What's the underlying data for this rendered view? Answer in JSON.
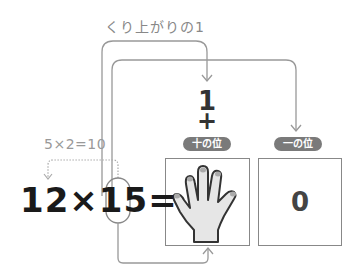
{
  "diagram": {
    "title": "くり上がりの1",
    "carry_digit": "1",
    "plus_sign": "+",
    "badges": {
      "tens": "十の位",
      "ones": "一の位"
    },
    "partial_product": "5×2=10",
    "equation": {
      "a": "12",
      "times": "×",
      "b_first": "1",
      "b_highlight": "5",
      "equals": "="
    },
    "boxes": {
      "tens": {
        "content": "hand-icon",
        "label": "five fingers"
      },
      "ones": {
        "value": "0"
      }
    },
    "colors": {
      "line": "#999999",
      "badge": "#7a7a7a",
      "text_dark": "#1a1a1a",
      "text_light": "#888888",
      "hand_fill": "#e6e6e6"
    }
  }
}
